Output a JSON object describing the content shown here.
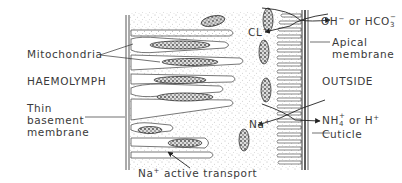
{
  "diagram": {
    "type": "labelled cell diagram",
    "regions": {
      "left": "HAEMOLYMPH",
      "right": "OUTSIDE"
    },
    "labels": {
      "mitochondria": "Mitochondria",
      "haemolymph": "HAEMOLYMPH",
      "basement_line1": "Thin",
      "basement_line2": "basement",
      "basement_line3": "membrane",
      "na_active_base": "Na",
      "na_active_sup": "+",
      "na_active_rest": " active transport",
      "oh_base": "OH",
      "oh_sup": "−",
      "oh_or": " or HCO",
      "oh_sub": "3",
      "oh_sup2": "−",
      "cl_base": "CL",
      "cl_sup": "−",
      "apical_line1": "Apical",
      "apical_line2": "membrane",
      "outside": "OUTSIDE",
      "na_base": "Na",
      "na_sup": "+",
      "nh_base": "NH",
      "nh_sub": "4",
      "nh_sup": "+",
      "nh_or": " or H",
      "nh_sup2": "+",
      "cuticle": "Cuticle"
    },
    "exchanges": [
      {
        "in": "Cl−",
        "out": "OH− or HCO3−"
      },
      {
        "in": "Na+",
        "out": "NH4+ or H+"
      }
    ],
    "colors": {
      "ink": "#3a3a3a",
      "background": "#ffffff"
    }
  }
}
